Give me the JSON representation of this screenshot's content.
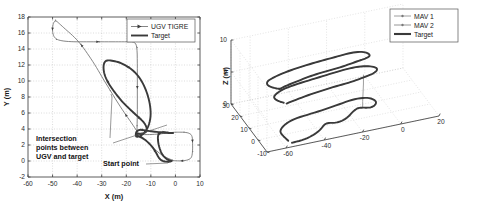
{
  "figure": {
    "panels": [
      "ugv-2d-trajectory",
      "mav-3d-trajectory"
    ]
  },
  "chart_data": [
    {
      "id": "left",
      "type": "line",
      "title": "",
      "xlabel": "X (m)",
      "ylabel": "Y (m)",
      "xlim": [
        -60,
        10
      ],
      "ylim": [
        -2,
        18
      ],
      "xticks": [
        -60,
        -50,
        -40,
        -30,
        -20,
        -10,
        0,
        10
      ],
      "xtick_labels": [
        "-60",
        "-50",
        "-40",
        "-30",
        "-20",
        "-10",
        "0",
        "10"
      ],
      "yticks": [
        -2,
        0,
        2,
        4,
        6,
        8,
        10,
        12,
        14,
        16,
        18
      ],
      "ytick_labels": [
        "-2",
        "0",
        "2",
        "4",
        "6",
        "8",
        "10",
        "12",
        "14",
        "16",
        "18"
      ],
      "grid": true,
      "legend_position": "top-right",
      "legend": [
        "UGV TIGRE",
        "Target"
      ],
      "annotations": [
        {
          "name": "intersection-annotation",
          "text": "Intersection points between UGV and target",
          "lines": [
            "Intersection",
            "points between",
            "UGV and target"
          ],
          "x": -40.5,
          "y": 3.2
        },
        {
          "name": "start-point-annotation",
          "text": "Start point",
          "lines": [
            "Start point"
          ],
          "x": -16.0,
          "y": 0.4
        }
      ],
      "series": [
        {
          "name": "UGV TIGRE",
          "style": "thin-marked",
          "color": "#6f6f6f",
          "points": [
            [
              -1.2,
              0.1
            ],
            [
              -5.0,
              0.6
            ],
            [
              -9.0,
              1.6
            ],
            [
              -12.5,
              2.7
            ],
            [
              -15.0,
              3.4
            ],
            [
              -17.5,
              4.6
            ],
            [
              -20.5,
              5.9
            ],
            [
              -23.5,
              7.3
            ],
            [
              -26.5,
              8.8
            ],
            [
              -29.5,
              10.3
            ],
            [
              -32.5,
              11.9
            ],
            [
              -35.5,
              13.3
            ],
            [
              -38.5,
              14.6
            ],
            [
              -41.5,
              15.6
            ],
            [
              -44.5,
              16.4
            ],
            [
              -47.0,
              17.1
            ],
            [
              -48.8,
              17.6
            ],
            [
              -49.8,
              17.2
            ],
            [
              -50.1,
              16.3
            ],
            [
              -49.6,
              15.6
            ],
            [
              -48.4,
              15.2
            ],
            [
              -46.0,
              15.0
            ],
            [
              -42.0,
              14.9
            ],
            [
              -37.0,
              14.9
            ],
            [
              -31.0,
              14.9
            ],
            [
              -25.0,
              14.9
            ],
            [
              -20.0,
              14.9
            ],
            [
              -16.5,
              14.9
            ],
            [
              -15.6,
              14.2
            ],
            [
              -15.5,
              12.0
            ],
            [
              -15.5,
              9.0
            ],
            [
              -15.5,
              6.0
            ],
            [
              -15.6,
              4.4
            ],
            [
              -15.7,
              3.5
            ],
            [
              -14.0,
              3.3
            ],
            [
              -10.0,
              3.3
            ],
            [
              -6.0,
              3.4
            ],
            [
              -3.0,
              3.5
            ],
            [
              -0.5,
              3.6
            ],
            [
              1.5,
              3.6
            ],
            [
              3.5,
              3.6
            ],
            [
              5.5,
              3.5
            ],
            [
              6.8,
              3.2
            ],
            [
              7.0,
              2.3
            ],
            [
              7.0,
              1.2
            ],
            [
              6.6,
              0.4
            ],
            [
              5.0,
              0.1
            ],
            [
              2.0,
              0.0
            ],
            [
              -1.0,
              0.05
            ]
          ]
        },
        {
          "name": "Target",
          "style": "thick",
          "color": "#3a3a3a",
          "points": [
            [
              -1.5,
              0.0
            ],
            [
              -3.5,
              0.2
            ],
            [
              -5.5,
              0.8
            ],
            [
              -6.8,
              1.9
            ],
            [
              -7.2,
              2.8
            ],
            [
              -7.0,
              3.3
            ],
            [
              -6.0,
              3.6
            ],
            [
              -4.0,
              3.6
            ],
            [
              -2.0,
              3.5
            ],
            [
              -0.5,
              3.5
            ],
            [
              -3.0,
              3.5
            ],
            [
              -6.5,
              3.6
            ],
            [
              -9.5,
              3.7
            ],
            [
              -12.0,
              3.8
            ],
            [
              -13.6,
              3.9
            ],
            [
              -14.6,
              3.9
            ],
            [
              -15.4,
              3.8
            ],
            [
              -16.0,
              3.6
            ],
            [
              -16.2,
              3.2
            ],
            [
              -15.8,
              3.0
            ],
            [
              -14.5,
              3.1
            ],
            [
              -13.0,
              3.4
            ],
            [
              -11.5,
              4.0
            ],
            [
              -10.5,
              4.8
            ],
            [
              -10.0,
              5.8
            ],
            [
              -10.3,
              7.0
            ],
            [
              -11.3,
              8.3
            ],
            [
              -13.0,
              9.6
            ],
            [
              -15.0,
              10.6
            ],
            [
              -17.5,
              11.4
            ],
            [
              -20.0,
              11.9
            ],
            [
              -22.5,
              12.3
            ],
            [
              -25.0,
              12.5
            ],
            [
              -27.2,
              12.6
            ],
            [
              -28.6,
              12.5
            ],
            [
              -29.3,
              12.0
            ],
            [
              -29.2,
              11.2
            ],
            [
              -28.4,
              10.4
            ],
            [
              -27.0,
              9.6
            ],
            [
              -25.0,
              8.7
            ],
            [
              -23.0,
              7.9
            ],
            [
              -21.0,
              7.2
            ],
            [
              -19.0,
              6.6
            ],
            [
              -17.2,
              6.1
            ],
            [
              -15.5,
              5.6
            ],
            [
              -14.0,
              5.2
            ],
            [
              -12.8,
              4.8
            ],
            [
              -12.0,
              4.4
            ],
            [
              -11.6,
              4.0
            ],
            [
              -11.8,
              3.7
            ],
            [
              -12.6,
              3.5
            ],
            [
              -13.8,
              3.4
            ],
            [
              -14.8,
              3.4
            ],
            [
              -15.6,
              3.4
            ],
            [
              -16.0,
              3.3
            ],
            [
              -15.0,
              3.1
            ],
            [
              -13.0,
              2.8
            ],
            [
              -11.0,
              2.3
            ],
            [
              -9.2,
              1.7
            ],
            [
              -7.8,
              1.0
            ],
            [
              -6.8,
              0.4
            ],
            [
              -5.5,
              0.0
            ],
            [
              -3.5,
              -0.1
            ],
            [
              -1.8,
              -0.05
            ]
          ]
        }
      ]
    },
    {
      "id": "right",
      "type": "line3d",
      "title": "",
      "xlabel": "",
      "ylabel": "",
      "zlabel": "Z (m)",
      "xlim": [
        -70,
        20
      ],
      "ylim": [
        -10,
        30
      ],
      "zlim": [
        0,
        10
      ],
      "xticks": [
        -60,
        -40,
        -20,
        0,
        20
      ],
      "xtick_labels": [
        "-60",
        "-40",
        "-20",
        "0",
        "20"
      ],
      "yticks": [
        -10,
        0,
        10,
        20,
        30
      ],
      "ytick_labels": [
        "-10",
        "0",
        "10",
        "20",
        "30"
      ],
      "zticks": [
        0,
        5,
        10
      ],
      "ztick_labels": [
        "0",
        "5",
        "10"
      ],
      "grid": true,
      "legend_position": "top-right",
      "legend": [
        "MAV 1",
        "MAV 2",
        "Target"
      ],
      "series": [
        {
          "name": "MAV 1",
          "style": "thin-marked",
          "color": "#868686"
        },
        {
          "name": "MAV 2",
          "style": "thin-marked",
          "color": "#7b7b7b"
        },
        {
          "name": "Target",
          "style": "thick",
          "color": "#3a3a3a"
        }
      ]
    }
  ],
  "left_panel": {
    "legend": {
      "items": [
        {
          "label": "UGV TIGRE",
          "style": "thin-marked"
        },
        {
          "label": "Target",
          "style": "thick"
        }
      ]
    },
    "xlabel": "X (m)",
    "ylabel": "Y (m)",
    "annotation_1_line_1": "Intersection",
    "annotation_1_line_2": "points between",
    "annotation_1_line_3": "UGV and target",
    "annotation_2": "Start point"
  },
  "right_panel": {
    "legend": {
      "items": [
        {
          "label": "MAV 1",
          "style": "thin-marked"
        },
        {
          "label": "MAV 2",
          "style": "thin-marked"
        },
        {
          "label": "Target",
          "style": "thick"
        }
      ]
    },
    "zlabel": "Z (m)"
  }
}
